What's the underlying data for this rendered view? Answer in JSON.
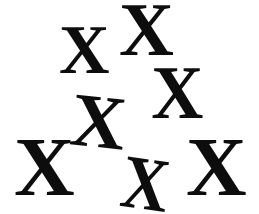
{
  "image": {
    "title": "X Glyph Scatter",
    "width": 259,
    "height": 214,
    "background_color": "#ffffff",
    "glyph_color": "#0d0d0d",
    "glyph_character": "X",
    "glyph_count": 7,
    "description": "Seven bold serif capital letter X glyphs scattered at varying sizes and slight rotations on a plain white background"
  },
  "glyphs": [
    {
      "id": "x-top-center",
      "char": "X",
      "left": 119,
      "top": -8,
      "font_size": 76,
      "rotation": 0,
      "scale_x": 1.0,
      "color": "#0d0d0d"
    },
    {
      "id": "x-upper-left",
      "char": "X",
      "left": 59,
      "top": 16,
      "font_size": 70,
      "rotation": 0,
      "scale_x": 1.0,
      "color": "#0d0d0d"
    },
    {
      "id": "x-middle-right",
      "char": "X",
      "left": 150,
      "top": 55,
      "font_size": 76,
      "rotation": 0,
      "scale_x": 0.95,
      "color": "#0d0d0d"
    },
    {
      "id": "x-center",
      "char": "X",
      "left": 71,
      "top": 84,
      "font_size": 76,
      "rotation": 6,
      "scale_x": 1.0,
      "color": "#0d0d0d"
    },
    {
      "id": "x-bottom-left",
      "char": "X",
      "left": 14,
      "top": 126,
      "font_size": 84,
      "rotation": 0,
      "scale_x": 1.0,
      "color": "#0d0d0d"
    },
    {
      "id": "x-bottom-center",
      "char": "X",
      "left": 118,
      "top": 146,
      "font_size": 76,
      "rotation": 8,
      "scale_x": 0.86,
      "color": "#0d0d0d"
    },
    {
      "id": "x-bottom-right",
      "char": "X",
      "left": 186,
      "top": 126,
      "font_size": 84,
      "rotation": 0,
      "scale_x": 1.0,
      "color": "#0d0d0d"
    }
  ]
}
